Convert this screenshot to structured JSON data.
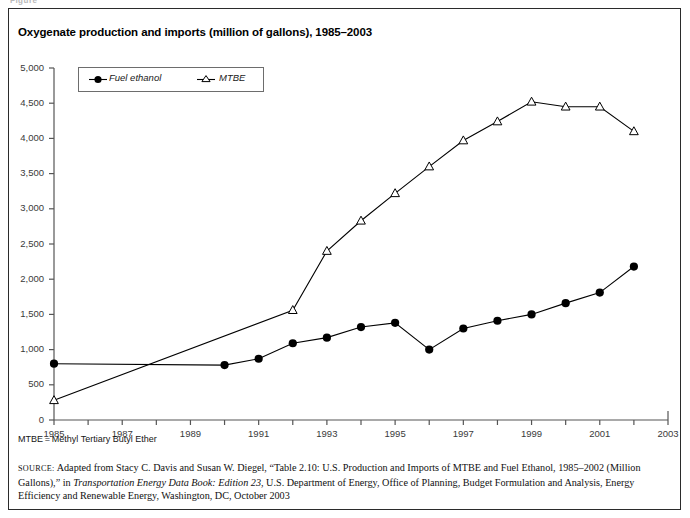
{
  "page": {
    "top_ghost_text": "Figure",
    "title": "Oxygenate production and imports (million of gallons), 1985–2003",
    "footnote": "MTBE = Methyl Tertiary Butyl Ether",
    "source_label": "SOURCE:",
    "source_text": " Adapted from Stacy C. Davis and Susan W. Diegel, “Table 2.10: U.S. Production and Imports of MTBE and Fuel Ethanol, 1985–2002 (Million Gallons),” in ",
    "source_italic": "Transportation Energy Data Book: Edition 23",
    "source_text2": ", U.S. Department of Energy, Office of Planning, Budget Formulation and Analysis, Energy Efficiency and Renewable Energy, Washington, DC, October 2003"
  },
  "colors": {
    "ink": "#000000",
    "axis": "#555555",
    "frame": "#2b2b2b",
    "label": "#3a3a3a"
  },
  "chart_data": {
    "type": "line",
    "title": "Oxygenate production and imports (million of gallons), 1985–2003",
    "xlabel": "",
    "ylabel": "",
    "xlim": [
      1985,
      2003
    ],
    "ylim": [
      0,
      5000
    ],
    "grid": false,
    "legend_position": "top-left-inset",
    "y_ticks": [
      0,
      500,
      1000,
      1500,
      2000,
      2500,
      3000,
      3500,
      4000,
      4500,
      5000
    ],
    "y_tick_labels": [
      "0",
      "500",
      "1,000",
      "1,500",
      "2,000",
      "2,500",
      "3,000",
      "3,500",
      "4,000",
      "4,500",
      "5,000"
    ],
    "x_ticks": [
      1985,
      1986,
      1987,
      1988,
      1989,
      1990,
      1991,
      1992,
      1993,
      1994,
      1995,
      1996,
      1997,
      1998,
      1999,
      2000,
      2001,
      2002,
      2003
    ],
    "x_tick_labels": [
      "1985",
      "",
      "1987",
      "",
      "1989",
      "",
      "1991",
      "",
      "1993",
      "",
      "1995",
      "",
      "1997",
      "",
      "1999",
      "",
      "2001",
      "",
      "2003"
    ],
    "series": [
      {
        "name": "Fuel ethanol",
        "marker": "filled-circle",
        "x": [
          1985,
          1990,
          1991,
          1992,
          1993,
          1994,
          1995,
          1996,
          1997,
          1998,
          1999,
          2000,
          2001,
          2002
        ],
        "values": [
          800,
          780,
          870,
          1090,
          1170,
          1320,
          1380,
          1000,
          1300,
          1410,
          1500,
          1660,
          1810,
          2180
        ]
      },
      {
        "name": "MTBE",
        "marker": "open-triangle",
        "x": [
          1985,
          1992,
          1993,
          1994,
          1995,
          1996,
          1997,
          1998,
          1999,
          2000,
          2001,
          2002
        ],
        "values": [
          280,
          1560,
          2400,
          2830,
          3220,
          3600,
          3970,
          4240,
          4520,
          4450,
          4450,
          4100
        ]
      }
    ]
  }
}
